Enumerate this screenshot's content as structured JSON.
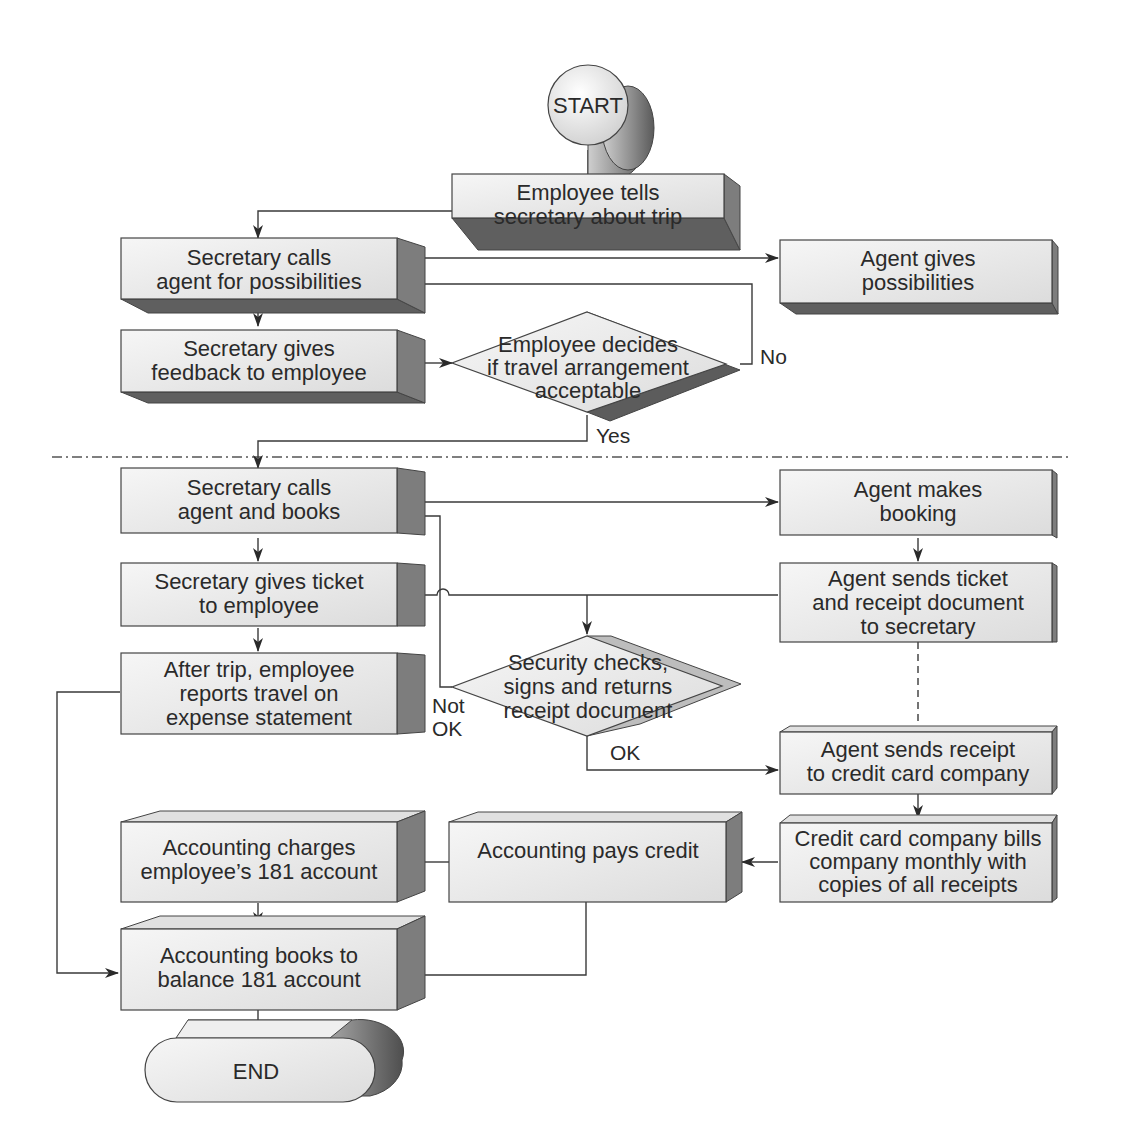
{
  "diagram": {
    "colors": {
      "box_front": "#ececec",
      "box_side": "#7d7d7d",
      "box_shadow": "#5f5f5f",
      "line": "#3a3a3a",
      "text": "#2a2a2a"
    },
    "start": {
      "label": "START"
    },
    "end": {
      "label": "END"
    },
    "nodes": {
      "employee_tells": {
        "lines": [
          "Employee tells",
          "secretary about trip"
        ]
      },
      "secretary_calls_possibilities": {
        "lines": [
          "Secretary calls",
          "agent for possibilities"
        ]
      },
      "agent_gives_possibilities": {
        "lines": [
          "Agent gives",
          "possibilities"
        ]
      },
      "secretary_feedback": {
        "lines": [
          "Secretary gives",
          "feedback to employee"
        ]
      },
      "employee_decides": {
        "lines": [
          "Employee decides",
          "if travel arrangement",
          "acceptable"
        ]
      },
      "secretary_calls_books": {
        "lines": [
          "Secretary calls",
          "agent and books"
        ]
      },
      "agent_makes_booking": {
        "lines": [
          "Agent makes",
          "booking"
        ]
      },
      "secretary_gives_ticket": {
        "lines": [
          "Secretary gives ticket",
          "to employee"
        ]
      },
      "agent_sends_ticket": {
        "lines": [
          "Agent sends ticket",
          "and receipt document",
          "to secretary"
        ]
      },
      "after_trip": {
        "lines": [
          "After trip, employee",
          "reports travel on",
          "expense statement"
        ]
      },
      "security_checks": {
        "lines": [
          "Security checks,",
          "signs and returns",
          "receipt document"
        ]
      },
      "agent_sends_receipt": {
        "lines": [
          "Agent sends receipt",
          "to credit card company"
        ]
      },
      "credit_card_bills": {
        "lines": [
          "Credit card company bills",
          "company monthly with",
          "copies of all receipts"
        ]
      },
      "accounting_charges": {
        "lines": [
          "Accounting charges",
          "employee’s 181 account"
        ]
      },
      "accounting_pays": {
        "lines": [
          "Accounting pays credit"
        ]
      },
      "accounting_books": {
        "lines": [
          "Accounting books to",
          "balance 181 account"
        ]
      }
    },
    "edge_labels": {
      "no": "No",
      "yes": "Yes",
      "not_ok_1": "Not",
      "not_ok_2": "OK",
      "ok": "OK"
    }
  }
}
